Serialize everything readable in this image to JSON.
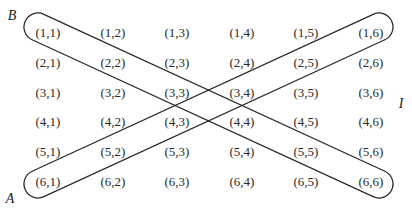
{
  "diagram": {
    "type": "grid-with-event-bands",
    "labels": {
      "B": "B",
      "A": "A",
      "I": "I"
    },
    "grid": {
      "rows": 6,
      "cols": 6,
      "cells": [
        [
          "(1,1)",
          "(1,2)",
          "(1,3)",
          "(1,4)",
          "(1,5)",
          "(1,6)"
        ],
        [
          "(2,1)",
          "(2,2)",
          "(2,3)",
          "(2,4)",
          "(2,5)",
          "(2,6)"
        ],
        [
          "(3,1)",
          "(3,2)",
          "(3,3)",
          "(3,4)",
          "(3,5)",
          "(3,6)"
        ],
        [
          "(4,1)",
          "(4,2)",
          "(4,3)",
          "(4,4)",
          "(4,5)",
          "(4,6)"
        ],
        [
          "(5,1)",
          "(5,2)",
          "(5,3)",
          "(5,4)",
          "(5,5)",
          "(5,6)"
        ],
        [
          "(6,1)",
          "(6,2)",
          "(6,3)",
          "(6,4)",
          "(6,5)",
          "(6,6)"
        ]
      ]
    },
    "bands": [
      {
        "name": "B",
        "from": "(1,1)",
        "to": "(6,6)",
        "description": "main diagonal"
      },
      {
        "name": "A",
        "from": "(6,1)",
        "to": "(1,6)",
        "description": "anti-diagonal"
      }
    ],
    "colors": {
      "stroke": "#2a2a2a",
      "text": "#2a2a2a",
      "background": "#ffffff"
    }
  }
}
